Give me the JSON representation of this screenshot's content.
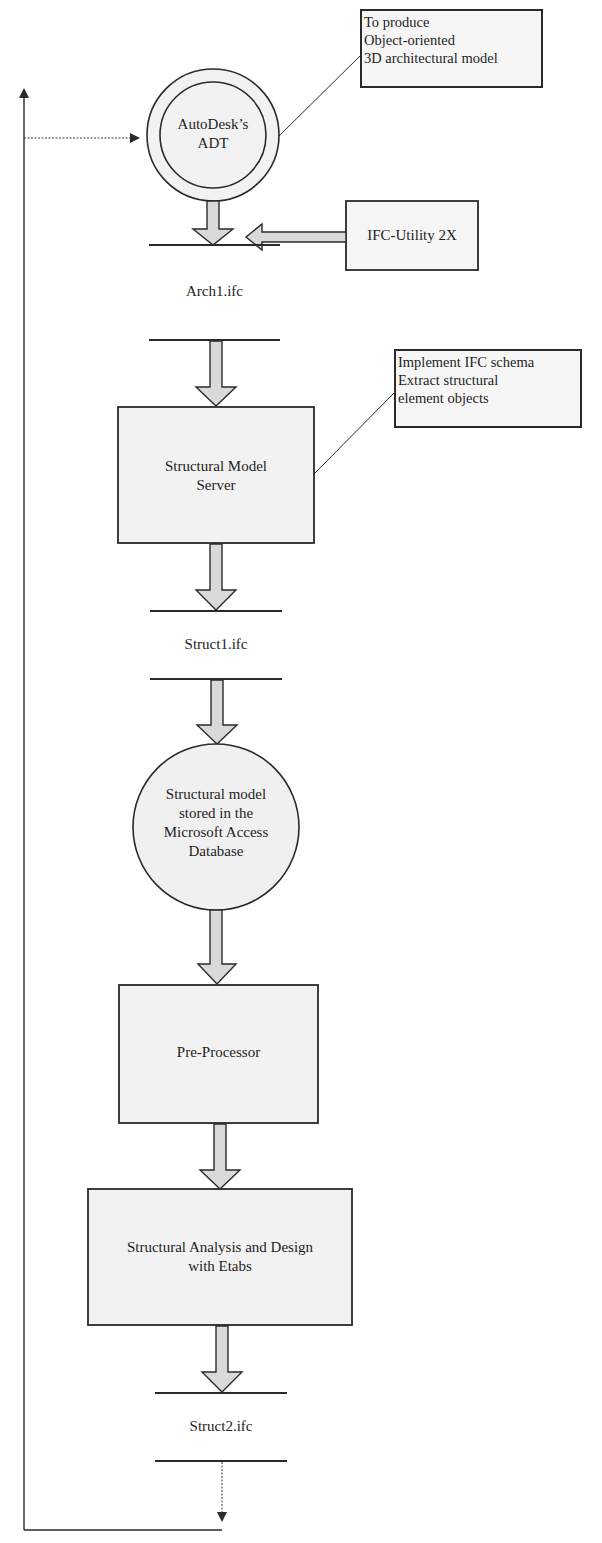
{
  "diagram": {
    "type": "flowchart",
    "colors": {
      "stroke": "#2a2a2a",
      "node_fill": "#f2f2f2",
      "arrow_fill": "#d9d9d9",
      "background": "#ffffff"
    },
    "nodes": {
      "adt": {
        "shape": "double-circle",
        "line1": "AutoDesk’s",
        "line2": "ADT"
      },
      "ifc_utility": {
        "shape": "rectangle",
        "label": "IFC-Utility 2X"
      },
      "arch1": {
        "shape": "data-store",
        "label": "Arch1.ifc"
      },
      "sms": {
        "shape": "rectangle",
        "line1": "Structural Model",
        "line2": "Server"
      },
      "struct1": {
        "shape": "data-store",
        "label": "Struct1.ifc"
      },
      "db": {
        "shape": "circle",
        "line1": "Structural model",
        "line2": "stored in the",
        "line3": "Microsoft Access",
        "line4": "Database"
      },
      "preproc": {
        "shape": "rectangle",
        "label": "Pre-Processor"
      },
      "analysis": {
        "shape": "rectangle",
        "line1": "Structural Analysis and Design",
        "line2": "with Etabs"
      },
      "struct2": {
        "shape": "data-store",
        "label": "Struct2.ifc"
      }
    },
    "annotations": {
      "adt_note": {
        "line1": "To produce",
        "line2": "Object-oriented",
        "line3": "3D architectural model"
      },
      "sms_note": {
        "line1": "Implement IFC schema",
        "line2": "Extract structural",
        "line3": "element objects"
      }
    },
    "edges": [
      {
        "from": "adt",
        "to": "arch1",
        "style": "block-arrow"
      },
      {
        "from": "ifc_utility",
        "to": "adt-arch1-arrow",
        "style": "block-arrow"
      },
      {
        "from": "arch1",
        "to": "sms",
        "style": "block-arrow"
      },
      {
        "from": "sms",
        "to": "struct1",
        "style": "block-arrow"
      },
      {
        "from": "struct1",
        "to": "db",
        "style": "block-arrow"
      },
      {
        "from": "db",
        "to": "preproc",
        "style": "block-arrow"
      },
      {
        "from": "preproc",
        "to": "analysis",
        "style": "block-arrow"
      },
      {
        "from": "analysis",
        "to": "struct2",
        "style": "block-arrow"
      },
      {
        "from": "struct2",
        "to": "adt",
        "style": "dotted-feedback-loop"
      }
    ]
  }
}
